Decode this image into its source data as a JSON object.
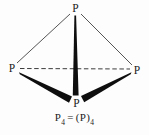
{
  "figure": {
    "atoms": {
      "top": {
        "label": "P"
      },
      "left": {
        "label": "P"
      },
      "right": {
        "label": "P"
      },
      "bottom": {
        "label": "P"
      }
    },
    "bonds": {
      "top_to_left": "plain",
      "top_to_right": "plain",
      "left_to_right": "dashed",
      "top_to_bottom": "wedge",
      "left_to_bottom": "wedge",
      "right_to_bottom": "wedge"
    },
    "caption": {
      "lhs": "P",
      "lhs_sub": "4",
      "equals": "=",
      "rhs": "(P)",
      "rhs_sub": "4"
    },
    "colors": {
      "bond_line": "#555555",
      "dashed_line": "#3c3c3c",
      "wedge_fill": "#0e0e0e",
      "label_text": "#1c1c1c",
      "background": "#fdfdfd"
    }
  }
}
